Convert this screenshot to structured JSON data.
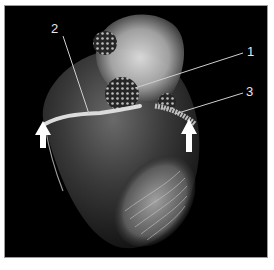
{
  "image": {
    "subject": "3D rendered heart with coronary vessels",
    "annotations": [
      {
        "id": "1",
        "text": "1"
      },
      {
        "id": "2",
        "text": "2"
      },
      {
        "id": "3",
        "text": "3"
      }
    ],
    "arrows": [
      {
        "name": "left-arrow",
        "direction": "up"
      },
      {
        "name": "right-arrow",
        "direction": "up"
      }
    ],
    "colors": {
      "background": "#000000",
      "label": "#e8e8e8",
      "leader_line": "#cfcfcf",
      "border": "#9a9a9a"
    }
  }
}
